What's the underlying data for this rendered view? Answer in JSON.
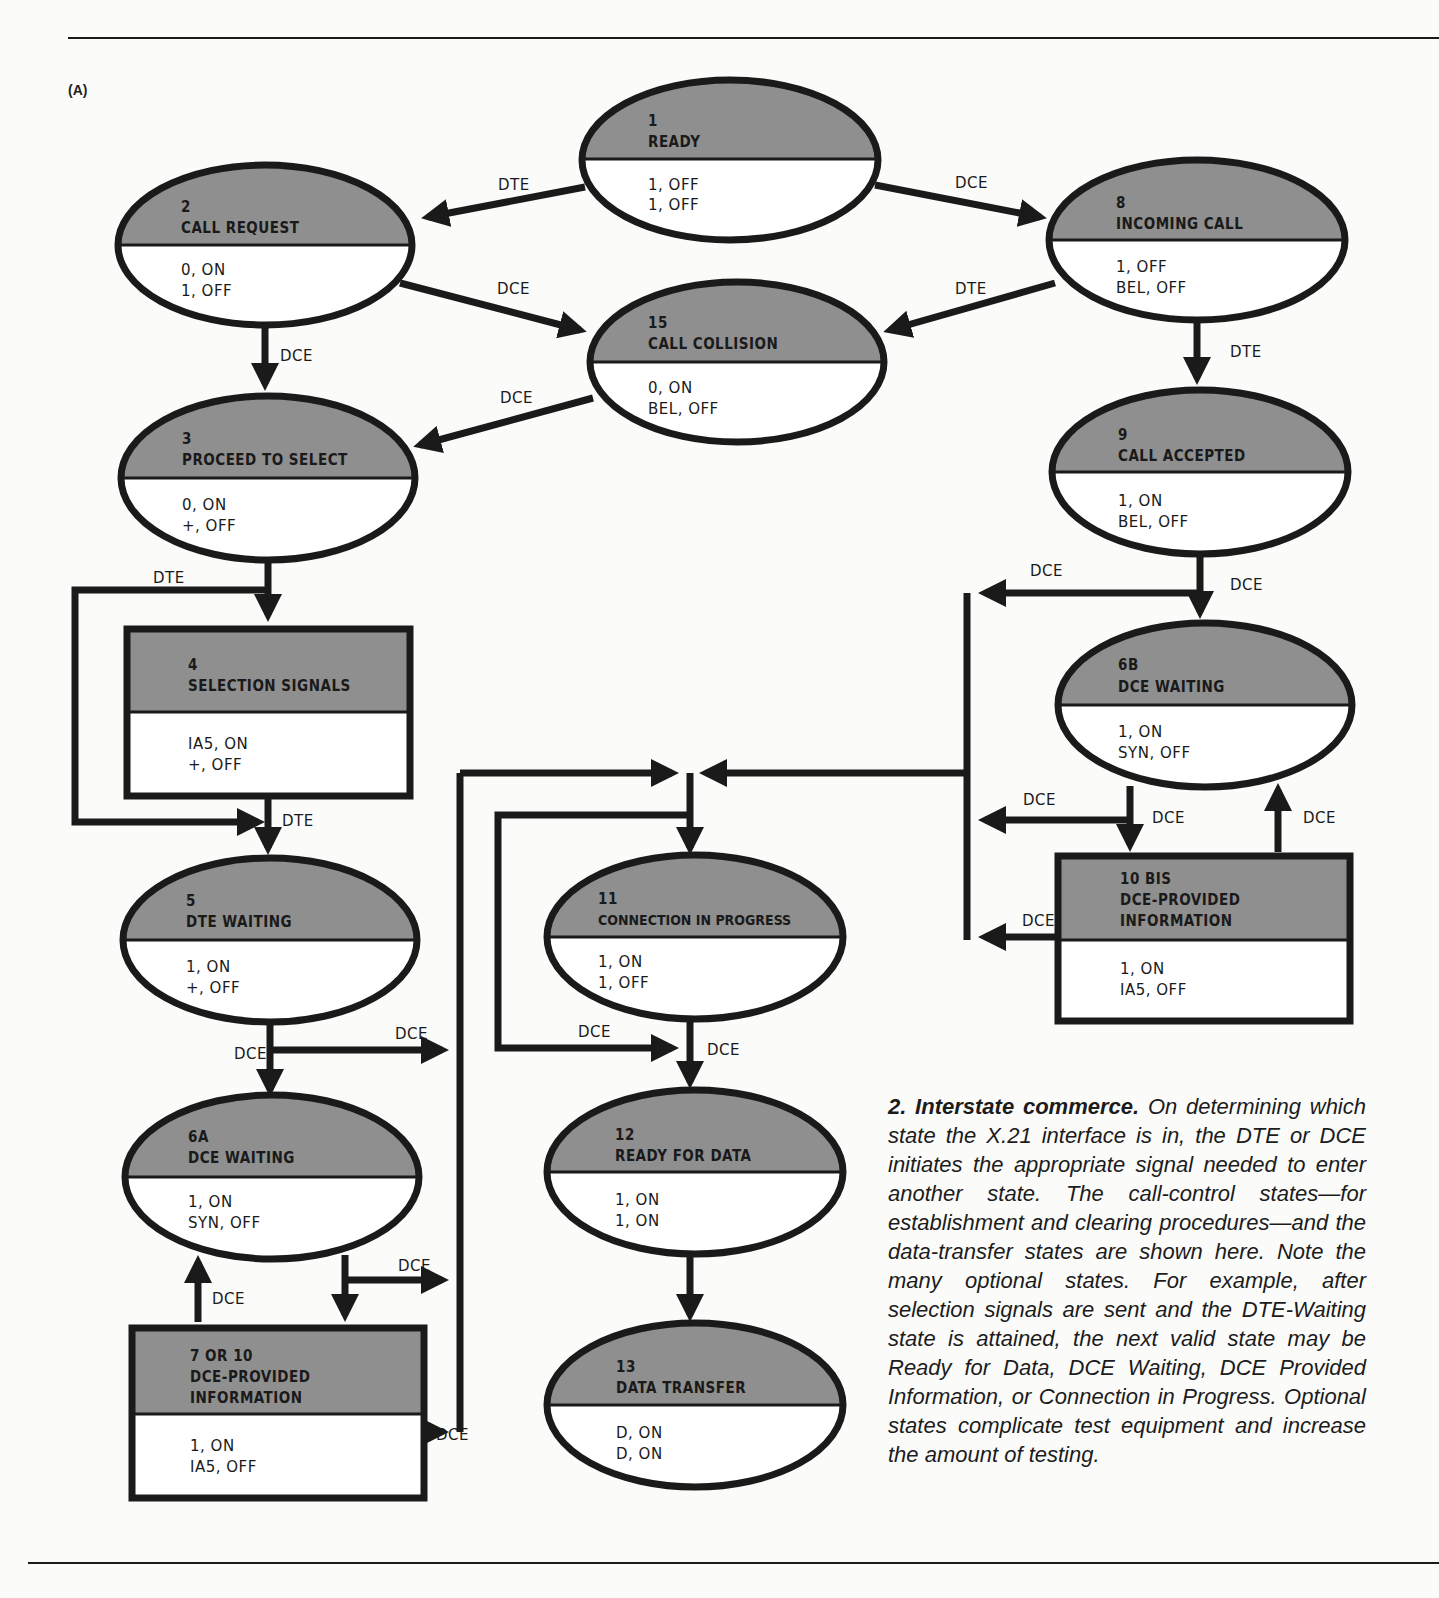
{
  "figure": {
    "panel_label": "(A)",
    "caption": {
      "title": "2. Interstate commerce.",
      "body": "On determining which state the X.21 interface is in, the DTE or DCE initiates the appropriate signal needed to enter another state. The call-control states—for establishment and clearing procedures—and the data-transfer states are shown here. Note the many optional states. For example, after selection signals are sent and the DTE-Waiting state is attained, the next valid state may be Ready for Data, DCE Waiting, DCE Provided Information, or Connection in Progress. Optional states complicate test equipment and increase the amount of testing."
    },
    "colors": {
      "state_header_fill": "#8f8f8f",
      "outline": "#1a1a1a",
      "background": "#fbfbfa"
    }
  },
  "states": {
    "s1": {
      "num": "1",
      "name": "READY",
      "name2": "",
      "v1": "1, OFF",
      "v2": "1, OFF",
      "shape": "ellipse"
    },
    "s2": {
      "num": "2",
      "name": "CALL REQUEST",
      "name2": "",
      "v1": "0, ON",
      "v2": "1, OFF",
      "shape": "ellipse"
    },
    "s8": {
      "num": "8",
      "name": "INCOMING CALL",
      "name2": "",
      "v1": "1, OFF",
      "v2": "BEL, OFF",
      "shape": "ellipse"
    },
    "s15": {
      "num": "15",
      "name": "CALL COLLISION",
      "name2": "",
      "v1": "0, ON",
      "v2": "BEL, OFF",
      "shape": "ellipse"
    },
    "s3": {
      "num": "3",
      "name": "PROCEED TO SELECT",
      "name2": "",
      "v1": "0, ON",
      "v2": "+, OFF",
      "shape": "ellipse"
    },
    "s9": {
      "num": "9",
      "name": "CALL ACCEPTED",
      "name2": "",
      "v1": "1, ON",
      "v2": "BEL, OFF",
      "shape": "ellipse"
    },
    "s4": {
      "num": "4",
      "name": "SELECTION SIGNALS",
      "name2": "",
      "v1": "IA5, ON",
      "v2": "+, OFF",
      "shape": "rect"
    },
    "s6b": {
      "num": "6B",
      "name": "DCE WAITING",
      "name2": "",
      "v1": "1, ON",
      "v2": "SYN, OFF",
      "shape": "ellipse"
    },
    "s10b": {
      "num": "10 BIS",
      "name": "DCE-PROVIDED",
      "name2": "INFORMATION",
      "v1": "1, ON",
      "v2": "IA5, OFF",
      "shape": "rect"
    },
    "s5": {
      "num": "5",
      "name": "DTE WAITING",
      "name2": "",
      "v1": "1, ON",
      "v2": "+, OFF",
      "shape": "ellipse"
    },
    "s11": {
      "num": "11",
      "name": "CONNECTION IN PROGRESS",
      "name2": "",
      "v1": "1, ON",
      "v2": "1, OFF",
      "shape": "ellipse"
    },
    "s6a": {
      "num": "6A",
      "name": "DCE WAITING",
      "name2": "",
      "v1": "1, ON",
      "v2": "SYN, OFF",
      "shape": "ellipse"
    },
    "s12": {
      "num": "12",
      "name": "READY FOR DATA",
      "name2": "",
      "v1": "1, ON",
      "v2": "1, ON",
      "shape": "ellipse"
    },
    "s7": {
      "num": "7 OR 10",
      "name": "DCE-PROVIDED",
      "name2": "INFORMATION",
      "v1": "1, ON",
      "v2": "IA5, OFF",
      "shape": "rect"
    },
    "s13": {
      "num": "13",
      "name": "DATA TRANSFER",
      "name2": "",
      "v1": "D, ON",
      "v2": "D, ON",
      "shape": "ellipse"
    }
  },
  "transitions": {
    "t1_2": "DTE",
    "t1_8": "DCE",
    "t2_15": "DCE",
    "t8_15": "DTE",
    "t2_3": "DCE",
    "t15_3": "DCE",
    "t8_9": "DTE",
    "t3_4": "DTE",
    "t3_bypass": "DTE",
    "t9_left": "DCE",
    "t9_6b": "DCE",
    "t6b_left": "DCE",
    "t6b_10b": "DCE",
    "t10b_6b": "DCE",
    "t10b_left": "DCE",
    "t5_bus": "DCE",
    "t5_6a": "DCE",
    "t6a_bus": "DCE",
    "t7_6a": "DCE",
    "t7_bus": "DCE",
    "t11_12_loop": "DCE",
    "t11_12": "DCE"
  }
}
